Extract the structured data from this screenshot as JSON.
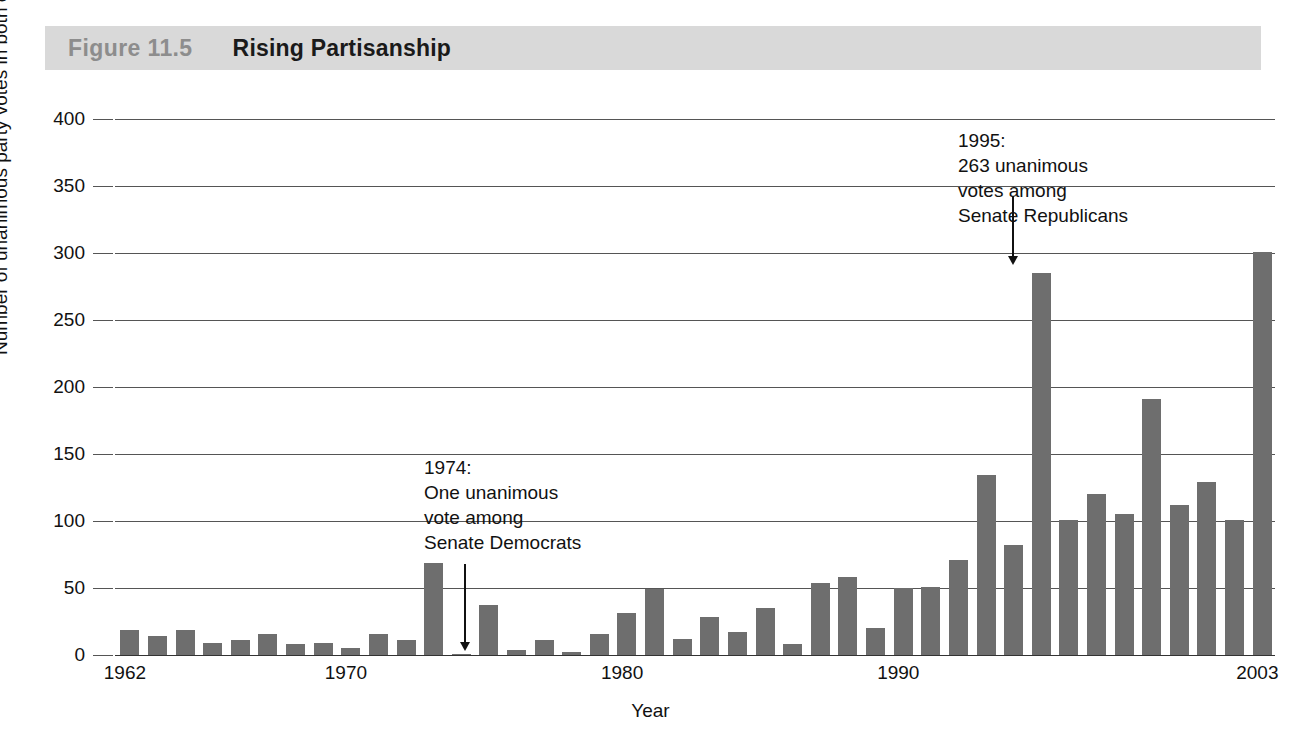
{
  "header": {
    "figure_number": "Figure 11.5",
    "figure_title": "Rising Partisanship",
    "band_color": "#d9d9d9",
    "number_color": "#8d8d8d"
  },
  "annotations": [
    {
      "id": "annot-1974",
      "text": "1974:\nOne unanimous\nvote among\nSenate Democrats",
      "year": 1974,
      "arrow": "down"
    },
    {
      "id": "annot-1995",
      "text": "1995:\n263 unanimous\nvotes among\nSenate Republicans",
      "year": 1995,
      "arrow": "down"
    }
  ],
  "chart_data": {
    "type": "bar",
    "title": "Rising Partisanship",
    "xlabel": "Year",
    "ylabel": "Number of unanimous party votes in both chambers",
    "ylim": [
      0,
      400
    ],
    "yticks": [
      0,
      50,
      100,
      150,
      200,
      250,
      300,
      350,
      400
    ],
    "xticks_shown": [
      "1962",
      "1970",
      "1980",
      "1990",
      "2003"
    ],
    "grid": "horizontal",
    "legend": "none",
    "bar_color": "#6e6e6e",
    "categories": [
      "1962",
      "1963",
      "1964",
      "1965",
      "1966",
      "1967",
      "1968",
      "1969",
      "1970",
      "1971",
      "1972",
      "1973",
      "1974",
      "1975",
      "1976",
      "1977",
      "1978",
      "1979",
      "1980",
      "1981",
      "1982",
      "1983",
      "1984",
      "1985",
      "1986",
      "1987",
      "1988",
      "1989",
      "1990",
      "1991",
      "1992",
      "1993",
      "1994",
      "1995",
      "1996",
      "1997",
      "1998",
      "1999",
      "2000",
      "2001",
      "2002",
      "2003"
    ],
    "values": [
      19,
      14,
      19,
      9,
      11,
      16,
      8,
      9,
      5,
      16,
      11,
      69,
      1,
      37,
      4,
      11,
      2,
      16,
      31,
      49,
      12,
      28,
      17,
      35,
      8,
      54,
      58,
      20,
      50,
      51,
      71,
      134,
      82,
      285,
      101,
      120,
      105,
      191,
      112,
      129,
      101,
      301
    ]
  }
}
